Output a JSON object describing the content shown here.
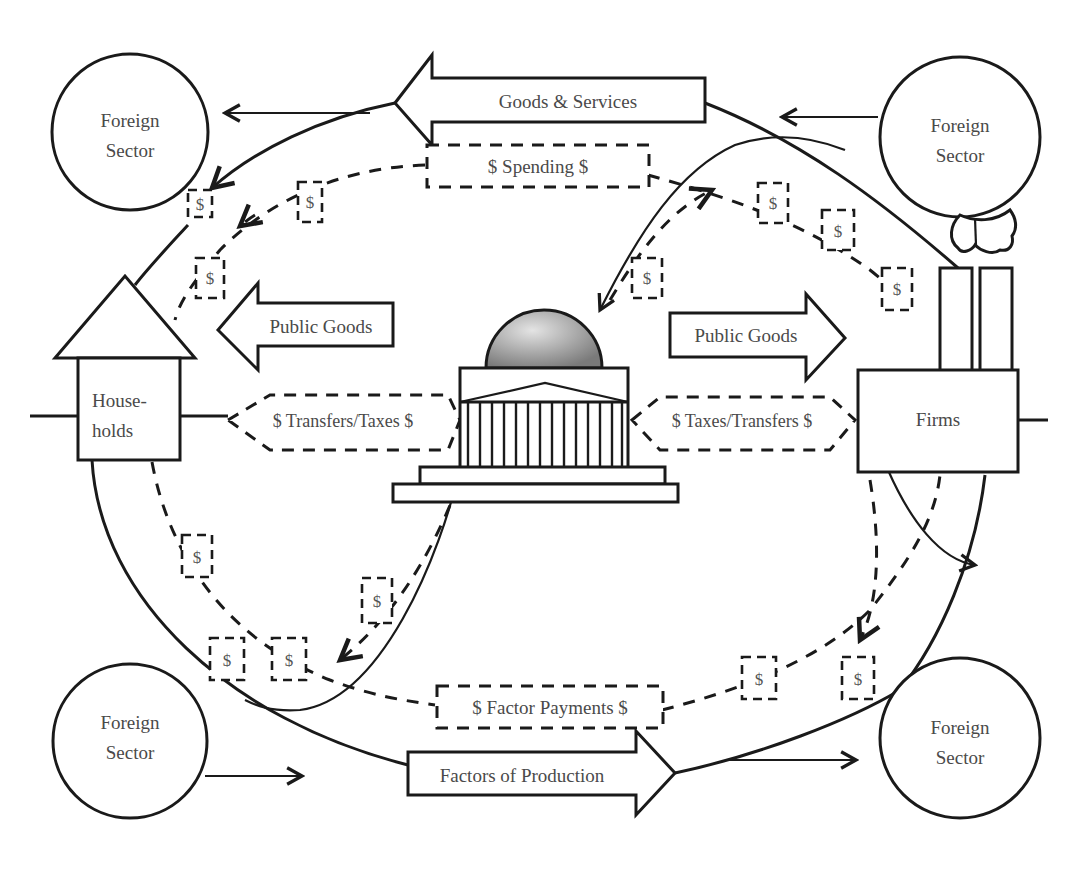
{
  "diagram": {
    "nodes": {
      "foreign_top_left": {
        "line1": "Foreign",
        "line2": "Sector"
      },
      "foreign_top_right": {
        "line1": "Foreign",
        "line2": "Sector"
      },
      "foreign_bottom_left": {
        "line1": "Foreign",
        "line2": "Sector"
      },
      "foreign_bottom_right": {
        "line1": "Foreign",
        "line2": "Sector"
      },
      "households": {
        "line1": "House-",
        "line2": "holds"
      },
      "firms": {
        "label": "Firms"
      },
      "government": {
        "icon": "capitol-building-icon"
      }
    },
    "flows": {
      "goods_services": "Goods & Services",
      "spending": "$ Spending $",
      "public_goods_left": "Public Goods",
      "public_goods_right": "Public Goods",
      "transfers_taxes": "$ Transfers/Taxes $",
      "taxes_transfers": "$ Taxes/Transfers $",
      "factor_payments": "$ Factor Payments $",
      "factors_of_production": "Factors of Production"
    },
    "money_tokens": {
      "symbol": "$",
      "count": 13
    },
    "colors": {
      "line": "#1a1a1a",
      "text": "#4a4a4a",
      "dome_light": "#e0e0e0",
      "dome_dark": "#7a7a7a",
      "background": "#ffffff"
    }
  }
}
